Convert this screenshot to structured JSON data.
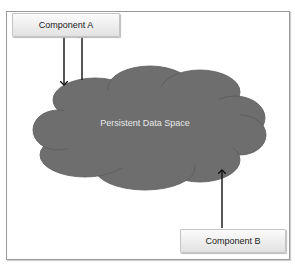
{
  "diagram": {
    "nodes": [
      {
        "id": "component-a",
        "label": "Component A",
        "shape": "rectangle"
      },
      {
        "id": "persistent-data-space",
        "label": "Persistent Data Space",
        "shape": "cloud",
        "color": "#6e6e6e"
      },
      {
        "id": "component-b",
        "label": "Component B",
        "shape": "rectangle"
      }
    ],
    "edges": [
      {
        "from": "component-a",
        "to": "persistent-data-space"
      },
      {
        "from": "persistent-data-space",
        "to": "component-a"
      },
      {
        "from": "component-b",
        "to": "persistent-data-space"
      }
    ]
  },
  "labels": {
    "component_a": "Component A",
    "component_b": "Component B",
    "cloud": "Persistent Data Space"
  }
}
